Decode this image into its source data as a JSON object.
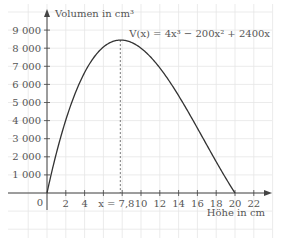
{
  "chart_data": {
    "type": "line",
    "title": "",
    "xlabel": "Höhe in cm",
    "ylabel": "Volumen in cm³",
    "formula": "V(x) = 4x³ − 200x² + 2400x",
    "x_ticks": [
      2,
      4,
      10,
      12,
      14,
      16,
      18,
      20,
      22
    ],
    "x_tick_labels": [
      "2",
      "4",
      "10",
      "12",
      "14",
      "16",
      "18",
      "20",
      "22"
    ],
    "origin_label": "0",
    "y_ticks": [
      1000,
      2000,
      3000,
      4000,
      5000,
      6000,
      7000,
      8000,
      9000
    ],
    "y_tick_labels": [
      "1000",
      "2000",
      "3000",
      "4000",
      "5000",
      "6000",
      "7000",
      "8000",
      "9000"
    ],
    "xlim": [
      -2,
      24
    ],
    "ylim": [
      -1500,
      10000
    ],
    "grid": true,
    "annotation": {
      "label": "x = 7,8",
      "x": 7.8,
      "y": 8450,
      "style": "dashed vertical line to maximum"
    },
    "series": [
      {
        "name": "V(x)",
        "coefficients": {
          "a3": 4,
          "a2": -200,
          "a1": 2400,
          "a0": 0
        },
        "domain": [
          0,
          20
        ],
        "x": [
          0,
          1,
          2,
          3,
          4,
          5,
          6,
          7,
          7.8,
          9,
          10,
          11,
          12,
          13,
          14,
          15,
          16,
          17,
          18,
          19,
          20
        ],
        "values": [
          0,
          2204,
          4032,
          5508,
          6656,
          7500,
          8064,
          8372,
          8450,
          8316,
          8000,
          7524,
          6912,
          6188,
          5376,
          4500,
          3584,
          2652,
          1728,
          836,
          0
        ]
      }
    ],
    "colors": {
      "curve": "#333333",
      "axis": "#444444",
      "grid": "#e6e6e6",
      "text": "#555555"
    }
  }
}
